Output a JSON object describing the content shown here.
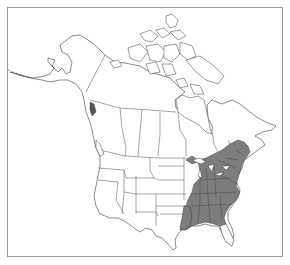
{
  "map": {
    "type": "species-range-map",
    "region": "North America",
    "colors": {
      "background": "#ffffff",
      "frame": "#9a9a9a",
      "outline": "#3a3a3a",
      "range_fill": "#7d7d7d"
    },
    "legend": null,
    "shaded_range": "Eastern United States and southeastern Canada"
  }
}
